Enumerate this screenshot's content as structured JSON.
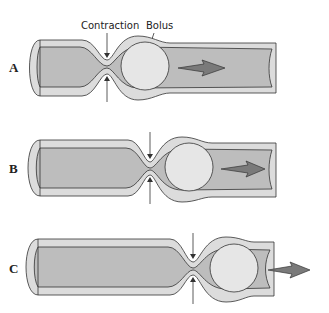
{
  "diagram": {
    "annotations": {
      "contraction": "Contraction",
      "bolus": "Bolus"
    },
    "panels": [
      {
        "label": "A",
        "stage": "contraction behind bolus, bolus in middle"
      },
      {
        "label": "B",
        "stage": "contraction wave moves forward, bolus advances"
      },
      {
        "label": "C",
        "stage": "bolus pushed out of tube end"
      }
    ],
    "colors": {
      "wall": "#dcdcdc",
      "lumen": "#bdbdbd",
      "bolus": "#e6e6e6",
      "arrow": "#7a7a7a",
      "outline": "#333333"
    }
  }
}
